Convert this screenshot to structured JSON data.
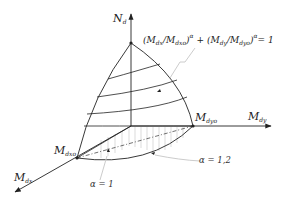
{
  "diagram": {
    "type": "3d-interaction-surface",
    "axes": {
      "n": {
        "label": "N",
        "subscript": "d"
      },
      "my": {
        "label": "M",
        "subscript": "dy"
      },
      "mx": {
        "label": "M",
        "subscript": "dx"
      }
    },
    "points": {
      "mdyo": {
        "label": "M",
        "subscript": "dyo"
      },
      "mdxo": {
        "label": "M",
        "subscript": "dxo"
      }
    },
    "formula": {
      "term1_num": "(M",
      "term1_num_sub": "dx",
      "term1_den": "/M",
      "term1_den_sub": "dxo",
      "term1_close": ")",
      "exp1": "α",
      "plus": " + ",
      "term2_num": "(M",
      "term2_num_sub": "dy",
      "term2_den": "/M",
      "term2_den_sub": "dyo",
      "term2_close": ")",
      "exp2": "α",
      "rhs": "= 1"
    },
    "annotations": {
      "alpha1": "α = 1",
      "alpha12": "α = 1,2"
    },
    "colors": {
      "line": "#222222",
      "hatch": "#b8b8b8",
      "leader": "#cccccc"
    }
  }
}
